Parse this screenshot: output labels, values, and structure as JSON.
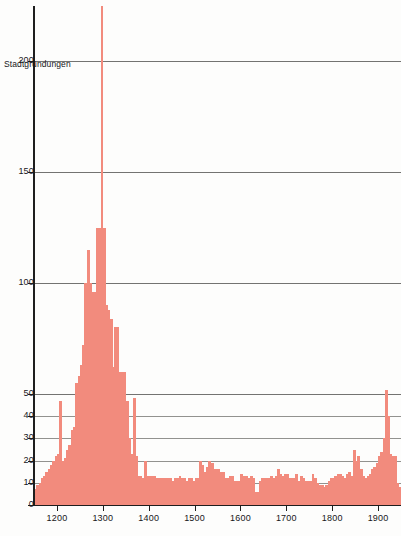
{
  "chart_data": {
    "type": "bar",
    "title": "",
    "subtitle": "",
    "ylabel": "Stadtgründungen",
    "xlabel": "",
    "xlim": [
      1150,
      1950
    ],
    "ylim": [
      0,
      230
    ],
    "grid": true,
    "legend": null,
    "bar_color": "#f28b7d",
    "axis_color": "#1e1e1e",
    "grid_color": "#5a5a58",
    "y_ticks": [
      {
        "value": 200,
        "label": "200"
      },
      {
        "value": 150,
        "label": "150"
      },
      {
        "value": 100,
        "label": "100"
      },
      {
        "value": 50,
        "label": "50"
      },
      {
        "value": 40,
        "label": "40"
      },
      {
        "value": 30,
        "label": "30"
      },
      {
        "value": 20,
        "label": "20"
      },
      {
        "value": 10,
        "label": "10"
      },
      {
        "value": 0,
        "label": "0"
      }
    ],
    "x_ticks": [
      {
        "value": 1200,
        "label": "1200"
      },
      {
        "value": 1300,
        "label": "1300"
      },
      {
        "value": 1400,
        "label": "1400"
      },
      {
        "value": 1500,
        "label": "1500"
      },
      {
        "value": 1600,
        "label": "1600"
      },
      {
        "value": 1700,
        "label": "1700"
      },
      {
        "value": 1800,
        "label": "1800"
      },
      {
        "value": 1900,
        "label": "1900"
      }
    ],
    "bin_width": 5,
    "x": [
      1150,
      1155,
      1160,
      1165,
      1170,
      1175,
      1180,
      1185,
      1190,
      1195,
      1200,
      1205,
      1210,
      1215,
      1220,
      1225,
      1230,
      1235,
      1240,
      1245,
      1250,
      1255,
      1260,
      1265,
      1270,
      1275,
      1280,
      1285,
      1290,
      1295,
      1300,
      1305,
      1310,
      1315,
      1320,
      1325,
      1330,
      1335,
      1340,
      1345,
      1350,
      1355,
      1360,
      1365,
      1370,
      1375,
      1380,
      1385,
      1390,
      1395,
      1400,
      1405,
      1410,
      1415,
      1420,
      1425,
      1430,
      1435,
      1440,
      1445,
      1450,
      1455,
      1460,
      1465,
      1470,
      1475,
      1480,
      1485,
      1490,
      1495,
      1500,
      1505,
      1510,
      1515,
      1520,
      1525,
      1530,
      1535,
      1540,
      1545,
      1550,
      1555,
      1560,
      1565,
      1570,
      1575,
      1580,
      1585,
      1590,
      1595,
      1600,
      1605,
      1610,
      1615,
      1620,
      1625,
      1630,
      1635,
      1640,
      1645,
      1650,
      1655,
      1660,
      1665,
      1670,
      1675,
      1680,
      1685,
      1690,
      1695,
      1700,
      1705,
      1710,
      1715,
      1720,
      1725,
      1730,
      1735,
      1740,
      1745,
      1750,
      1755,
      1760,
      1765,
      1770,
      1775,
      1780,
      1785,
      1790,
      1795,
      1800,
      1805,
      1810,
      1815,
      1820,
      1825,
      1830,
      1835,
      1840,
      1845,
      1850,
      1855,
      1860,
      1865,
      1870,
      1875,
      1880,
      1885,
      1890,
      1895,
      1900,
      1905,
      1910,
      1915,
      1920,
      1925,
      1930,
      1935,
      1940,
      1945
    ],
    "values": [
      7,
      9,
      10,
      12,
      13,
      15,
      16,
      18,
      20,
      22,
      23,
      47,
      20,
      21,
      25,
      27,
      34,
      35,
      55,
      58,
      63,
      72,
      100,
      115,
      100,
      96,
      96,
      125,
      125,
      228,
      125,
      90,
      88,
      84,
      62,
      80,
      80,
      60,
      60,
      60,
      47,
      30,
      23,
      48,
      22,
      13,
      13,
      12,
      20,
      13,
      13,
      13,
      13,
      12,
      12,
      12,
      12,
      12,
      12,
      12,
      11,
      12,
      12,
      13,
      12,
      12,
      11,
      12,
      12,
      11,
      12,
      12,
      20,
      18,
      15,
      17,
      20,
      19,
      16,
      16,
      16,
      15,
      15,
      12,
      12,
      13,
      13,
      11,
      11,
      11,
      14,
      13,
      13,
      12,
      13,
      12,
      6,
      6,
      11,
      12,
      12,
      12,
      12,
      13,
      12,
      13,
      16,
      14,
      13,
      14,
      14,
      12,
      12,
      12,
      14,
      11,
      13,
      12,
      11,
      11,
      11,
      14,
      12,
      10,
      9,
      9,
      8,
      9,
      11,
      12,
      12,
      13,
      14,
      14,
      13,
      12,
      14,
      15,
      13,
      25,
      20,
      22,
      16,
      13,
      12,
      13,
      14,
      16,
      17,
      19,
      22,
      24,
      30,
      52,
      40,
      23,
      22,
      22,
      10,
      8
    ]
  }
}
